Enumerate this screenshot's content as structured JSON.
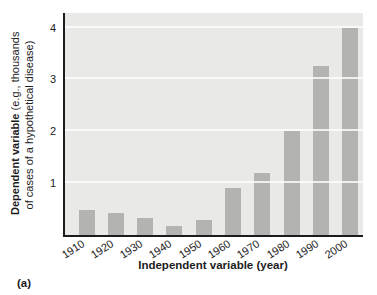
{
  "figure": {
    "panel_label": "(a)"
  },
  "chart_data": {
    "type": "bar",
    "title": "",
    "categories": [
      "1910",
      "1920",
      "1930",
      "1940",
      "1950",
      "1960",
      "1970",
      "1980",
      "1990",
      "2000"
    ],
    "values": [
      0.48,
      0.43,
      0.32,
      0.18,
      0.29,
      0.9,
      1.2,
      2.0,
      3.25,
      4.0
    ],
    "xlabel": "Independent variable (year)",
    "ylabel": "Dependent variable (e.g., thousands of cases of a hypothetical disease)",
    "ylabel_line1_bold": "Dependent variable",
    "ylabel_line1_rest": " (e.g., thousands",
    "ylabel_line2": "of cases of a hypothetical disease)",
    "yticks": [
      1,
      2,
      3,
      4
    ],
    "ylim": [
      0,
      4.28
    ],
    "grid": "horizontal white gridlines at integer ticks, drawn over bars",
    "legend": "none",
    "colors": {
      "bar": "#b3b3b1",
      "plot_background": "#e9e9e7",
      "gridline": "#ffffff",
      "axis": "#1c1c1c",
      "text": "#1c1c1c",
      "page_background": "#ffffff"
    }
  }
}
